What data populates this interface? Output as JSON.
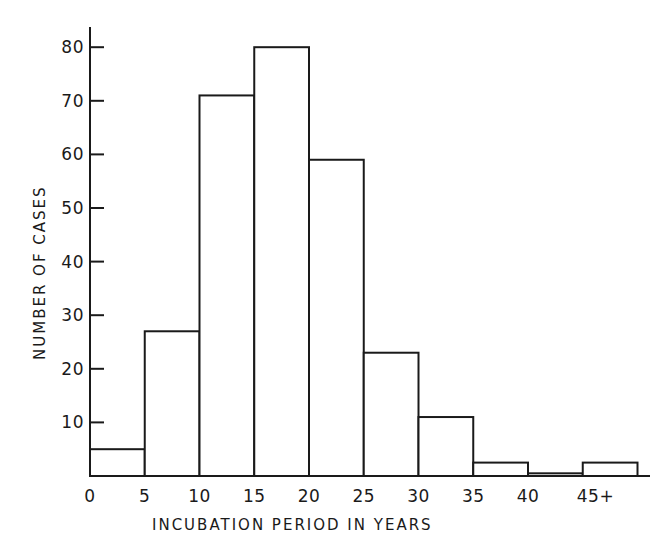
{
  "chart_data": {
    "type": "bar",
    "title": "",
    "xlabel": "INCUBATION PERIOD IN YEARS",
    "ylabel": "NUMBER OF CASES",
    "categories": [
      "0-5",
      "5-10",
      "10-15",
      "15-20",
      "20-25",
      "25-30",
      "30-35",
      "35-40",
      "40-45",
      "45+"
    ],
    "bin_edges": [
      0,
      5,
      10,
      15,
      20,
      25,
      30,
      35,
      40,
      45,
      50
    ],
    "values": [
      5,
      27,
      71,
      80,
      59,
      23,
      11,
      2.5,
      0.5,
      2.5
    ],
    "x_tick_labels": [
      "0",
      "5",
      "10",
      "15",
      "20",
      "25",
      "30",
      "35",
      "40",
      "45+"
    ],
    "y_tick_labels": [
      "10",
      "20",
      "30",
      "40",
      "50",
      "60",
      "70",
      "80"
    ],
    "y_ticks": [
      10,
      20,
      30,
      40,
      50,
      60,
      70,
      80
    ],
    "ylim": [
      0,
      85
    ],
    "grid": false,
    "legend": null,
    "style": "histogram, outlined bars, no fill"
  },
  "colors": {
    "ink": "#1a1a1a",
    "background": "#ffffff"
  }
}
